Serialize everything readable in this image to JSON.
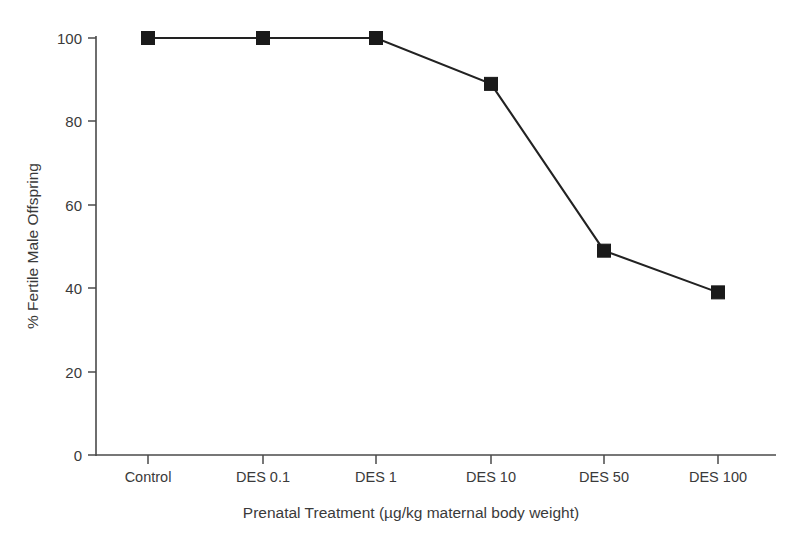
{
  "chart_data": {
    "type": "line",
    "title": "",
    "xlabel": "Prenatal Treatment (µg/kg maternal body weight)",
    "ylabel": "% Fertile Male Offspring",
    "categories": [
      "Control",
      "DES 0.1",
      "DES 1",
      "DES 10",
      "DES 50",
      "DES 100"
    ],
    "values": [
      100,
      100,
      100,
      89,
      49,
      39
    ],
    "series": [
      {
        "name": "% Fertile Male Offspring",
        "values": [
          100,
          100,
          100,
          89,
          49,
          39
        ]
      }
    ],
    "ylim": [
      0,
      100
    ],
    "ytick_labels": [
      "0",
      "20",
      "40",
      "60",
      "80",
      "100"
    ],
    "ytick_values": [
      0,
      20,
      40,
      60,
      80,
      100
    ],
    "grid": false,
    "legend": false,
    "legend_position": "none",
    "marker": "filled-square",
    "line_color": "#1a1a1a",
    "marker_color": "#1a1a1a",
    "background_color": "#ffffff",
    "axis_color": "#4a4a4a",
    "spines": [
      "left",
      "bottom"
    ]
  },
  "axes": {
    "y_tick_0": "0",
    "y_tick_1": "20",
    "y_tick_2": "40",
    "y_tick_3": "60",
    "y_tick_4": "80",
    "y_tick_5": "100",
    "x_tick_0": "Control",
    "x_tick_1": "DES 0.1",
    "x_tick_2": "DES 1",
    "x_tick_3": "DES 10",
    "x_tick_4": "DES 50",
    "x_tick_5": "DES 100",
    "y_axis_title": "% Fertile Male Offspring",
    "x_axis_title": "Prenatal Treatment (µg/kg maternal body weight)"
  }
}
